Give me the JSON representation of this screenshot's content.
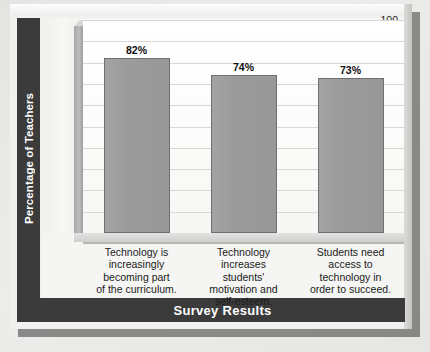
{
  "chart_data": {
    "type": "bar",
    "title": "",
    "xlabel": "Survey Results",
    "ylabel": "Percentage of Teachers",
    "ylim": [
      0,
      100
    ],
    "ytick_step": 10,
    "grid": true,
    "legend": "none",
    "categories": [
      "Technology is increasingly becoming part of the curriculum.",
      "Technology increases students' motivation and self-esteem.",
      "Students need access to technology in order to succeed."
    ],
    "category_lines": [
      [
        "Technology is",
        "increasingly",
        "becoming part",
        "of the curriculum."
      ],
      [
        "Technology",
        "increases",
        "students'",
        "motivation and",
        "self-esteem."
      ],
      [
        "Students need",
        "access to",
        "technology in",
        "order to succeed."
      ]
    ],
    "values": [
      82,
      74,
      73
    ],
    "value_labels": [
      "82%",
      "74%",
      "73%"
    ],
    "yticks": [
      "100",
      "90",
      "80",
      "70",
      "60",
      "50",
      "40",
      "30",
      "20",
      "10",
      "0"
    ],
    "colors": {
      "bar_fill": "#9a9a9a",
      "bar_border": "#6f6f6f",
      "band": "#3b3b3b",
      "band_text": "#ffffff",
      "plot_background": "#ffffff",
      "gridline": "#d7d7d5",
      "card_background": "#f0f0ee",
      "page_background": "#e8e8e6",
      "text": "#1b1b1b"
    }
  }
}
